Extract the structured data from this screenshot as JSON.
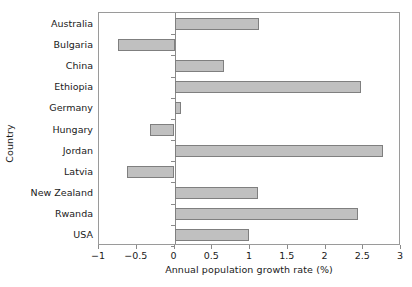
{
  "chart_data": {
    "type": "bar",
    "orientation": "horizontal",
    "title": "",
    "xlabel": "Annual population growth rate (%)",
    "ylabel": "Country",
    "categories": [
      "Australia",
      "Bulgaria",
      "China",
      "Ethiopia",
      "Germany",
      "Hungary",
      "Jordan",
      "Latvia",
      "New Zealand",
      "Rwanda",
      "USA"
    ],
    "values": [
      1.12,
      -0.75,
      0.66,
      2.47,
      0.08,
      -0.33,
      2.76,
      -0.63,
      1.1,
      2.43,
      0.99
    ],
    "xlim": [
      -1,
      3.0
    ],
    "xticks": [
      -1,
      -0.5,
      0,
      0.5,
      1,
      1.5,
      2,
      2.5,
      3
    ],
    "xtick_labels": [
      "−1",
      "−0.5",
      "0",
      "0.5",
      "1",
      "1.5",
      "2",
      "2.5",
      "3"
    ],
    "grid": false,
    "legend": null,
    "bar_fill_color": "#c0c0c0",
    "bar_edge_color": "#7f7f7f",
    "axis_color": "#9a9a9a",
    "background_color": "#ffffff"
  },
  "axes": {
    "x_title": "Annual population growth rate (%)",
    "y_title": "Country"
  }
}
